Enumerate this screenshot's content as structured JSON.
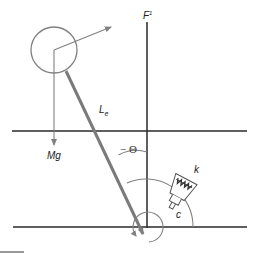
{
  "diagram": {
    "type": "inverted pendulum with torsional spring-damper",
    "colors": {
      "line_dark": "#2a2a2a",
      "line_gray": "#808080",
      "rod": "#7a7a7a",
      "background": "#ffffff"
    },
    "labels": {
      "force": "F",
      "force_sup": "1",
      "length": "L",
      "length_sub": "e",
      "weight": "Mg",
      "angle": "− Θ",
      "spring": "k",
      "damper": "c"
    },
    "elements": [
      {
        "name": "mass",
        "shape": "circle",
        "center": [
          54,
          50
        ],
        "radius": 23
      },
      {
        "name": "rod",
        "from": [
          66,
          70
        ],
        "to": [
          144,
          236
        ]
      },
      {
        "name": "vertical-reference-axis",
        "x": 147,
        "y": [
          22,
          228
        ]
      },
      {
        "name": "upper-horizontal-line",
        "y": 131,
        "x": [
          12,
          247
        ]
      },
      {
        "name": "ground-line",
        "y": 227,
        "x": [
          13,
          247
        ]
      },
      {
        "name": "weight-arrow",
        "from": [
          54,
          50
        ],
        "to": [
          54,
          146
        ]
      },
      {
        "name": "force-arrow",
        "from": [
          54,
          50
        ],
        "to": [
          111,
          27
        ]
      },
      {
        "name": "pivot",
        "center": [
          147,
          227
        ]
      }
    ]
  }
}
